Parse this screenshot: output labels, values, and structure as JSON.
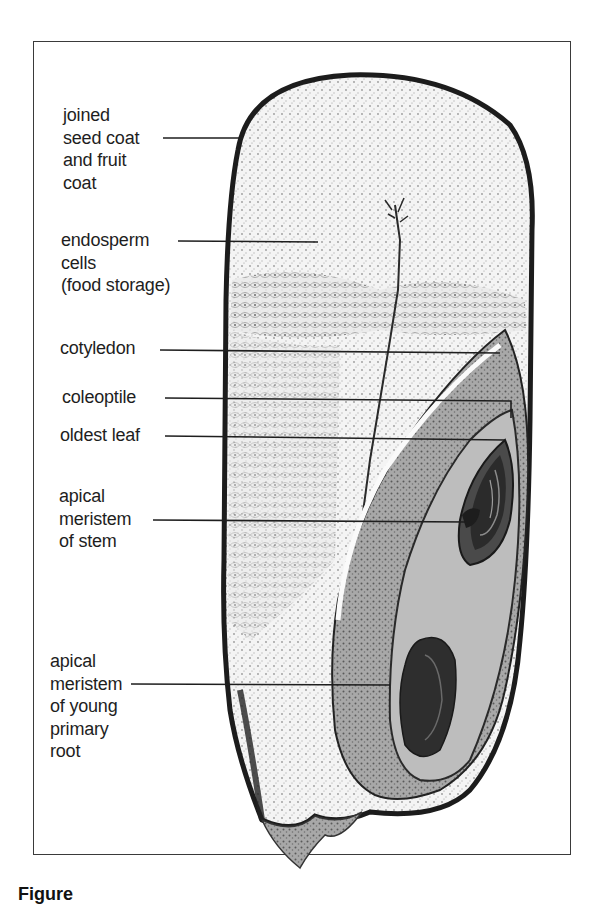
{
  "figure": {
    "caption_visible": "Figure",
    "labels": [
      {
        "id": "seed-coat",
        "lines": [
          "joined",
          "seed coat",
          "and fruit",
          "coat"
        ],
        "x": 63,
        "y": 104,
        "leader": {
          "x1": 163,
          "y1": 138,
          "x2": 243,
          "y2": 138
        }
      },
      {
        "id": "endosperm",
        "lines": [
          "endosperm",
          "cells",
          "(food storage)"
        ],
        "x": 61,
        "y": 229,
        "leader": {
          "x1": 178,
          "y1": 241,
          "x2": 318,
          "y2": 242
        }
      },
      {
        "id": "cotyledon",
        "lines": [
          "cotyledon"
        ],
        "x": 60,
        "y": 337,
        "leader": {
          "x1": 160,
          "y1": 350,
          "x2": 500,
          "y2": 353
        }
      },
      {
        "id": "coleoptile",
        "lines": [
          "coleoptile"
        ],
        "x": 62,
        "y": 386,
        "leader": {
          "x1": 165,
          "y1": 398,
          "x2": 511,
          "y2": 401,
          "drop_to": 418
        }
      },
      {
        "id": "oldest-leaf",
        "lines": [
          "oldest leaf"
        ],
        "x": 60,
        "y": 424,
        "leader": {
          "x1": 165,
          "y1": 436,
          "x2": 505,
          "y2": 440
        }
      },
      {
        "id": "apical-meristem-stem",
        "lines": [
          "apical",
          "meristem",
          "of stem"
        ],
        "x": 59,
        "y": 485,
        "leader": {
          "x1": 153,
          "y1": 520,
          "x2": 467,
          "y2": 522
        }
      },
      {
        "id": "apical-meristem-root",
        "lines": [
          "apical",
          "meristem",
          "of young",
          "primary",
          "root"
        ],
        "x": 50,
        "y": 650,
        "leader": {
          "x1": 131,
          "y1": 684,
          "x2": 390,
          "y2": 685
        }
      }
    ]
  },
  "colors": {
    "ink": "#1e1e1e",
    "frame": "#3a3a3a",
    "tissue_dark": "#2b2b2b",
    "tissue_mid": "#8a8a8a",
    "tissue_light": "#d8d8d8",
    "paper": "#ffffff"
  }
}
